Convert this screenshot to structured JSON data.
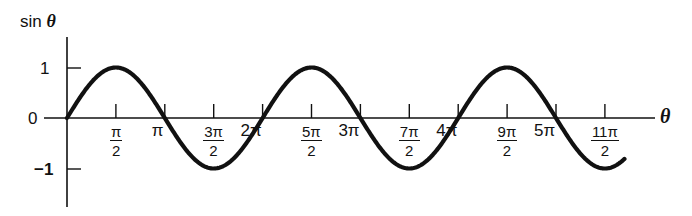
{
  "chart_data": {
    "type": "line",
    "title": "",
    "function": "sin θ",
    "xlabel": "θ",
    "ylabel": "sin θ",
    "x_units": "radians (multiples of π)",
    "xlim_pi": [
      0,
      5.7
    ],
    "ylim": [
      -1,
      1
    ],
    "grid": false,
    "legend": null,
    "y_ticks": [
      {
        "value": 1,
        "label": "1"
      },
      {
        "value": 0,
        "label": "0"
      },
      {
        "value": -1,
        "label": "−1"
      }
    ],
    "x_ticks": [
      {
        "value_pi": 0.5,
        "label": "π/2",
        "num": "π",
        "den": "2",
        "type": "frac"
      },
      {
        "value_pi": 1,
        "label": "π",
        "type": "int"
      },
      {
        "value_pi": 1.5,
        "label": "3π/2",
        "num": "3π",
        "den": "2",
        "type": "frac"
      },
      {
        "value_pi": 2,
        "label": "2π",
        "type": "int"
      },
      {
        "value_pi": 2.5,
        "label": "5π/2",
        "num": "5π",
        "den": "2",
        "type": "frac"
      },
      {
        "value_pi": 3,
        "label": "3π",
        "type": "int"
      },
      {
        "value_pi": 3.5,
        "label": "7π/2",
        "num": "7π",
        "den": "2",
        "type": "frac"
      },
      {
        "value_pi": 4,
        "label": "4π",
        "type": "int"
      },
      {
        "value_pi": 4.5,
        "label": "9π/2",
        "num": "9π",
        "den": "2",
        "type": "frac"
      },
      {
        "value_pi": 5,
        "label": "5π",
        "type": "int"
      },
      {
        "value_pi": 5.5,
        "label": "11π/2",
        "num": "11π",
        "den": "2",
        "type": "frac"
      }
    ],
    "series": [
      {
        "name": "sin θ",
        "color": "#111111",
        "x_pi": [
          0,
          0.5,
          1,
          1.5,
          2,
          2.5,
          3,
          3.5,
          4,
          4.5,
          5,
          5.5,
          5.7
        ],
        "values": [
          0,
          1,
          0,
          -1,
          0,
          1,
          0,
          -1,
          0,
          1,
          0,
          -1,
          -0.81
        ]
      }
    ]
  },
  "labels": {
    "y_axis": "sin",
    "y_axis_symbol": "θ",
    "x_axis_symbol": "θ",
    "y_one": "1",
    "y_zero": "0",
    "y_minus_one": "−1"
  },
  "colors": {
    "ink": "#111111",
    "background": "#ffffff"
  }
}
